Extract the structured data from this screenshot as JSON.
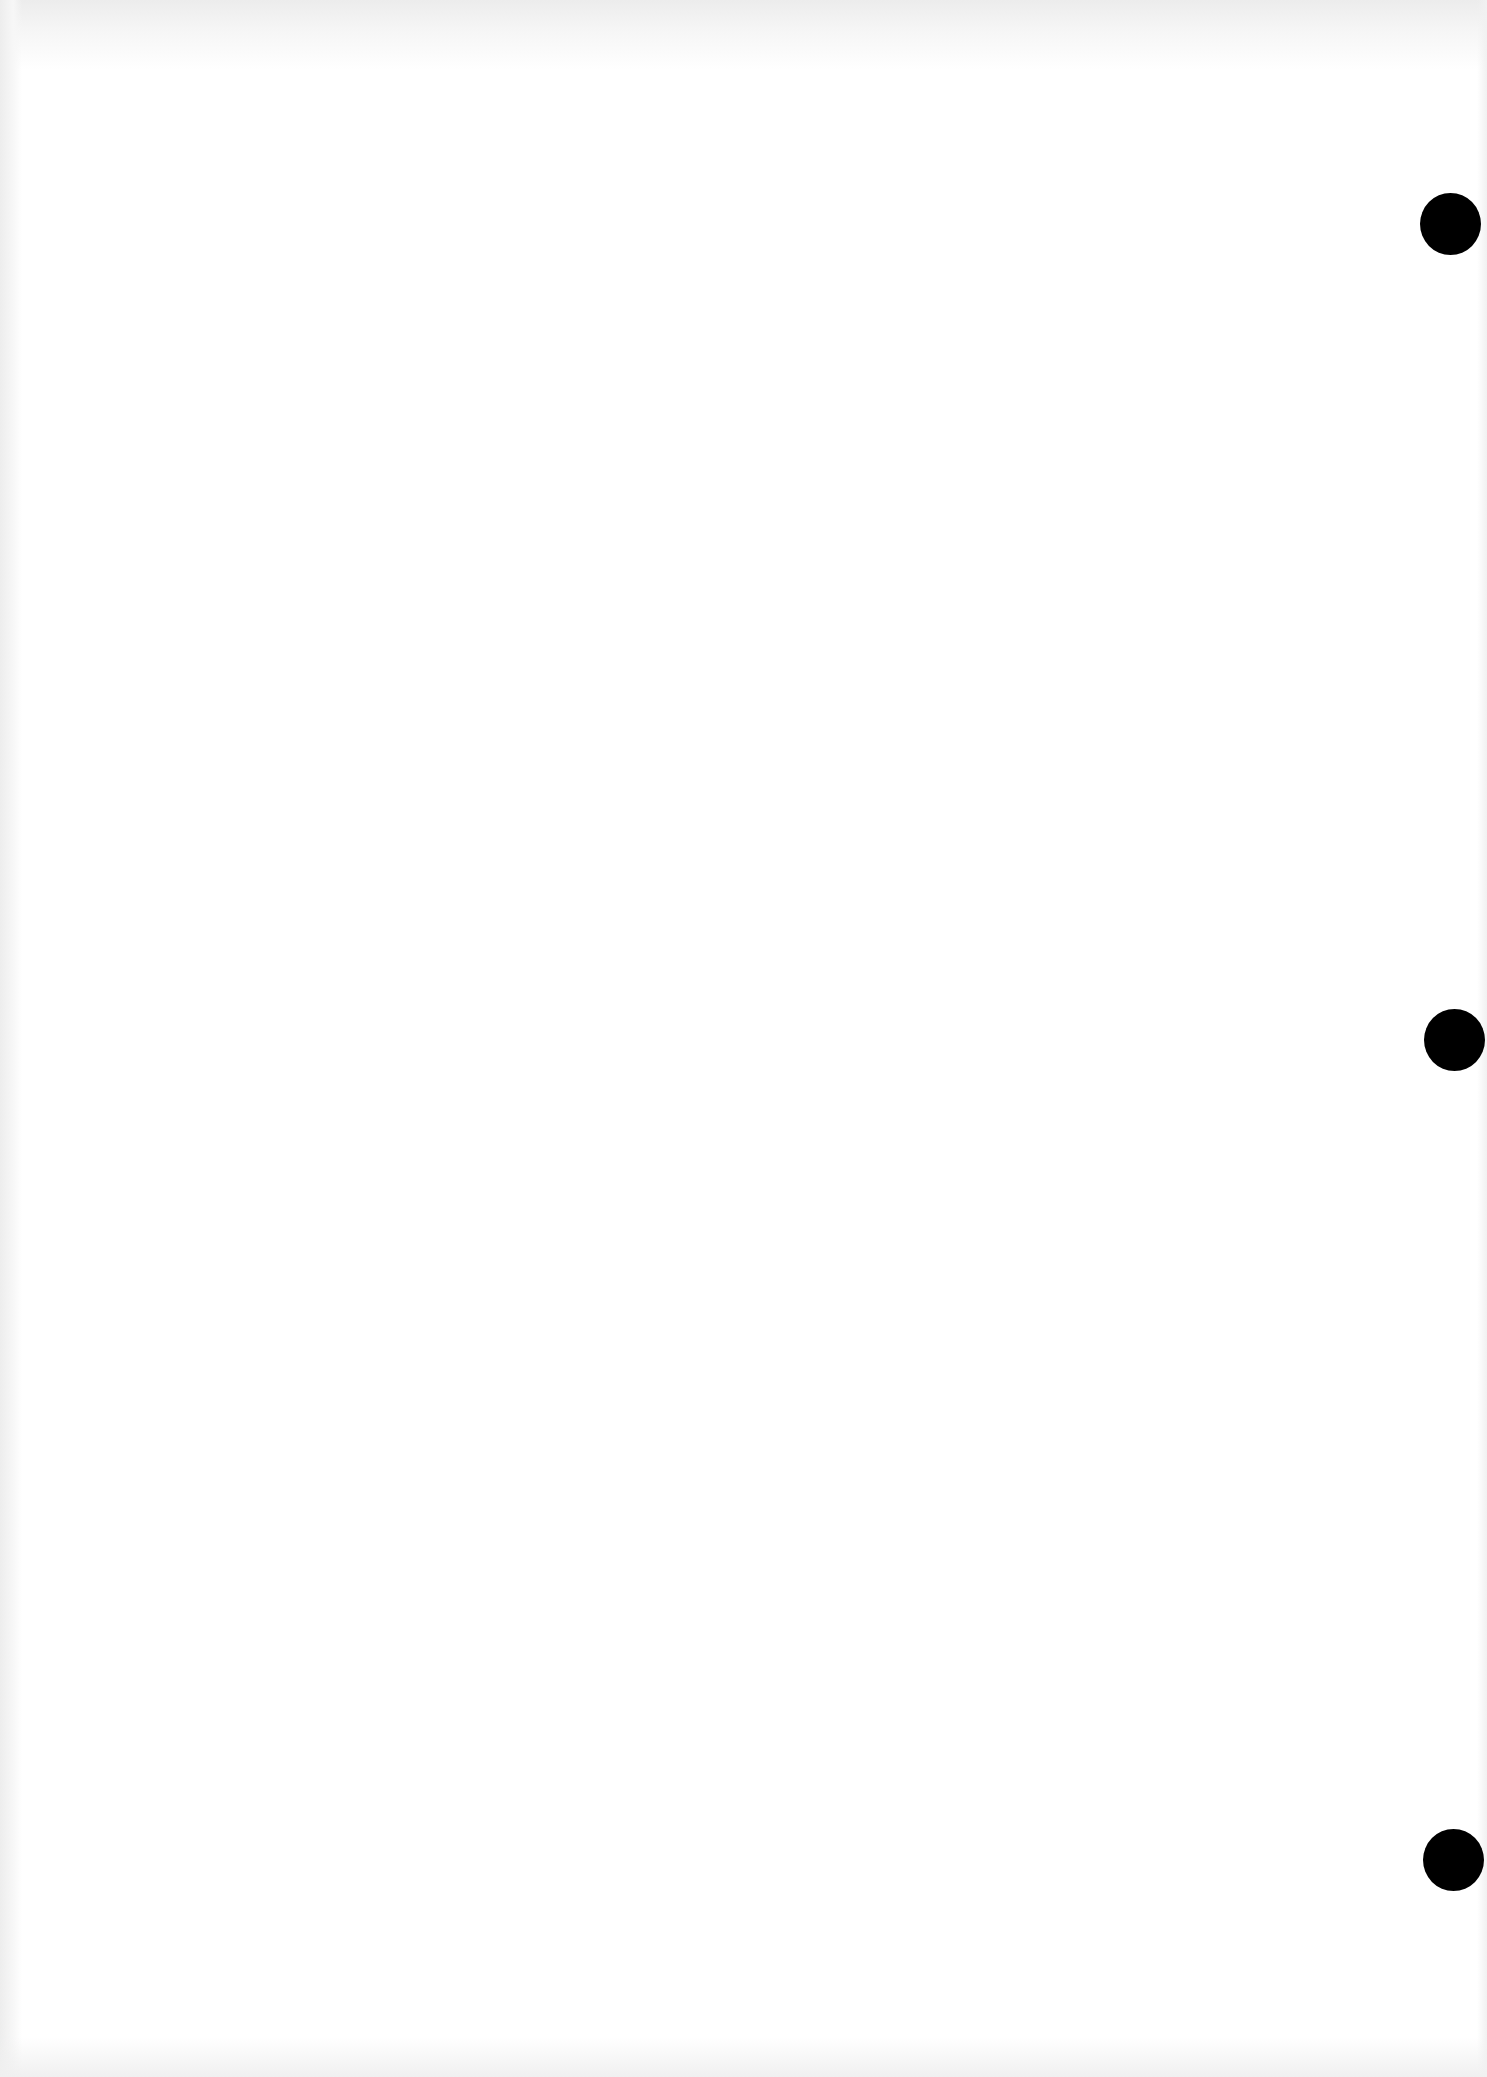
{
  "document": {
    "page": {
      "content": "",
      "background_color": "#ffffff"
    },
    "punch_holes": [
      {
        "position": "top",
        "color": "#000000"
      },
      {
        "position": "middle",
        "color": "#000000"
      },
      {
        "position": "bottom",
        "color": "#000000"
      }
    ]
  }
}
